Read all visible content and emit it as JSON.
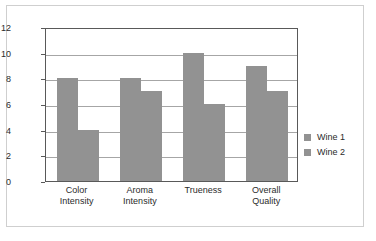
{
  "chart_data": {
    "type": "bar",
    "title": "",
    "xlabel": "",
    "ylabel": "",
    "categories": [
      "Color Intensity",
      "Aroma Intensity",
      "Trueness",
      "Overall Quality"
    ],
    "category_lines": [
      [
        "Color",
        "Intensity"
      ],
      [
        "Aroma",
        "Intensity"
      ],
      [
        "Trueness",
        ""
      ],
      [
        "Overall",
        "Quality"
      ]
    ],
    "series": [
      {
        "name": "Wine 1",
        "values": [
          8,
          8,
          10,
          9
        ],
        "color": "#929292"
      },
      {
        "name": "Wine 2",
        "values": [
          4,
          7,
          6,
          7
        ],
        "color": "#929292"
      }
    ],
    "ylim": [
      0,
      12
    ],
    "y_ticks": [
      0,
      2,
      4,
      6,
      8,
      10,
      12
    ],
    "y_tick_labels": [
      "0",
      "2",
      "4",
      "6",
      "8",
      "10",
      "12"
    ],
    "grid": true,
    "grid_axis": "y",
    "legend_position": "right"
  },
  "legend": {
    "items": [
      {
        "label": "Wine 1"
      },
      {
        "label": "Wine 2"
      }
    ]
  },
  "colors": {
    "bar": "#929292",
    "gridline": "#a6a6a6",
    "axis": "#595959",
    "frame": "#cfcfcf",
    "text": "#2b2b2b",
    "background": "#ffffff"
  }
}
